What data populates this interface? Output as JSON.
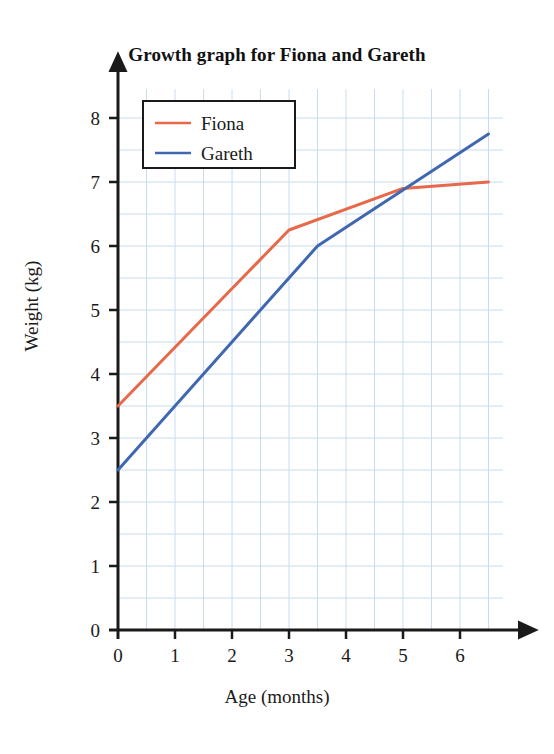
{
  "chart_data": {
    "type": "line",
    "title": "Growth graph for Fiona and Gareth",
    "xlabel": "Age (months)",
    "ylabel": "Weight (kg)",
    "xlim": [
      0,
      6.75
    ],
    "ylim": [
      0,
      8.45
    ],
    "xticks": [
      0,
      1,
      2,
      3,
      4,
      5,
      6
    ],
    "yticks": [
      0,
      1,
      2,
      3,
      4,
      5,
      6,
      7,
      8
    ],
    "grid": true,
    "grid_step": 0.5,
    "grid_color": "#c9dcef",
    "legend_position": "upper left",
    "axis_arrows": true,
    "series": [
      {
        "name": "Fiona",
        "color": "#e8694a",
        "x": [
          0,
          3,
          5,
          6.5
        ],
        "values": [
          3.5,
          6.25,
          6.9,
          7.0
        ]
      },
      {
        "name": "Gareth",
        "color": "#3f68b0",
        "x": [
          0,
          3.5,
          6.5
        ],
        "values": [
          2.5,
          6.0,
          7.75
        ]
      }
    ]
  },
  "legend": {
    "items": [
      {
        "label": "Fiona",
        "color": "#e8694a"
      },
      {
        "label": "Gareth",
        "color": "#3f68b0"
      }
    ]
  },
  "axis": {
    "x_tick_labels": [
      "0",
      "1",
      "2",
      "3",
      "4",
      "5",
      "6"
    ],
    "y_tick_labels": [
      "0",
      "1",
      "2",
      "3",
      "4",
      "5",
      "6",
      "7",
      "8"
    ]
  }
}
